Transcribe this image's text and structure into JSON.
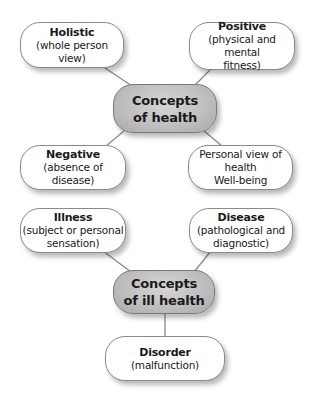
{
  "diagram": {
    "type": "concept-map",
    "line_color": "#8a8a8a",
    "hub_color": "#bdbdbd",
    "nodes": {
      "holistic": {
        "title": "Holistic",
        "desc": "(whole person view)"
      },
      "positive": {
        "title": "Positive",
        "desc1": "(physical and mental",
        "desc2": "fitness)"
      },
      "concepts_health": {
        "line1": "Concepts",
        "line2": "of health"
      },
      "negative": {
        "title": "Negative",
        "desc": "(absence of disease)"
      },
      "personal": {
        "line1": "Personal view of health",
        "line2": "Well-being"
      },
      "illness": {
        "title": "Illness",
        "desc1": "(subject or personal",
        "desc2": "sensation)"
      },
      "disease": {
        "title": "Disease",
        "desc1": "(pathological and",
        "desc2": "diagnostic)"
      },
      "concepts_ill_health": {
        "line1": "Concepts",
        "line2": "of ill health"
      },
      "disorder": {
        "title": "Disorder",
        "desc": "(malfunction)"
      }
    },
    "edges": [
      [
        "holistic",
        "concepts_health"
      ],
      [
        "positive",
        "concepts_health"
      ],
      [
        "concepts_health",
        "negative"
      ],
      [
        "concepts_health",
        "personal"
      ],
      [
        "illness",
        "concepts_ill_health"
      ],
      [
        "disease",
        "concepts_ill_health"
      ],
      [
        "concepts_ill_health",
        "disorder"
      ]
    ]
  }
}
